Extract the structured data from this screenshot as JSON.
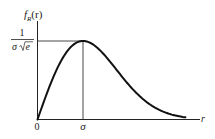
{
  "chart_data": {
    "type": "line",
    "title": "",
    "function": "Rayleigh probability density f_R(r) = (r/σ²)·exp(-r²/(2σ²))",
    "xlabel": "r",
    "ylabel": "f_R(r)",
    "ylabel_main": "f",
    "ylabel_sub": "R",
    "ylabel_arg": "(r)",
    "x_ticks": [
      {
        "value": 0,
        "label": "0"
      },
      {
        "value": 1,
        "label": "σ"
      }
    ],
    "y_ticks": [
      {
        "value": 1,
        "label_numerator": "1",
        "label_denominator": "σ√e",
        "label": "1/(σ√e)"
      }
    ],
    "annotations": [
      {
        "type": "guide-line",
        "orientation": "horizontal",
        "at": "1/(σ√e)",
        "from_x": 0,
        "to_x": "σ"
      },
      {
        "type": "guide-line",
        "orientation": "vertical",
        "at": "σ",
        "from_y": 0,
        "to_y": "1/(σ√e)"
      }
    ],
    "peak": {
      "x": "σ",
      "y": "1/(σ√e)"
    },
    "xlim": [
      0,
      3.5
    ],
    "ylim": [
      0,
      1.15
    ],
    "x_units": "multiples of σ",
    "y_units": "multiples of 1/(σ√e)",
    "curve_x_range": [
      0,
      3.25
    ],
    "grid": false,
    "legend": null,
    "series": [
      {
        "name": "f_R(r)",
        "x": [
          0,
          0.25,
          0.5,
          0.75,
          1.0,
          1.25,
          1.5,
          1.75,
          2.0,
          2.25,
          2.5,
          2.75,
          3.0,
          3.25
        ],
        "y": [
          0,
          0.4,
          0.73,
          0.94,
          1.0,
          0.94,
          0.8,
          0.62,
          0.45,
          0.29,
          0.18,
          0.1,
          0.05,
          0.02
        ]
      }
    ]
  },
  "labels": {
    "y_axis_f": "f",
    "y_axis_sub": "R",
    "y_axis_arg": "(r)",
    "y_tick_num": "1",
    "y_tick_den_sigma": "σ",
    "y_tick_den_e": "e",
    "x_tick_zero": "0",
    "x_tick_sigma": "σ",
    "x_axis_r": "r"
  }
}
